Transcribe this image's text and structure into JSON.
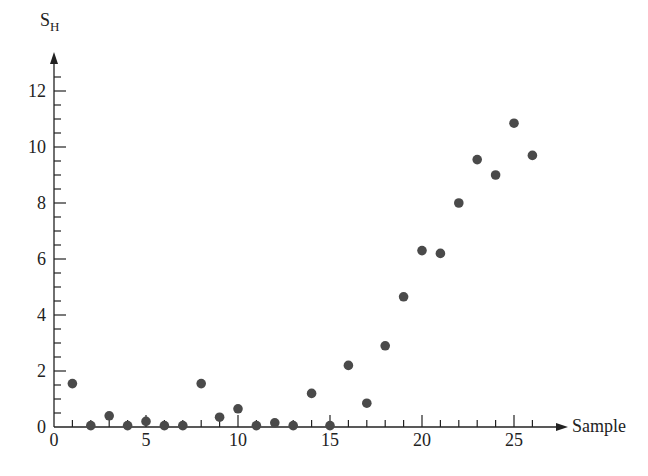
{
  "chart_data": {
    "type": "scatter",
    "title": "",
    "xlabel": "Sample",
    "ylabel": "S_H",
    "ylabel_main": "S",
    "ylabel_sub": "H",
    "xlim": [
      0,
      27
    ],
    "ylim": [
      0,
      13
    ],
    "x_ticks_major": [
      0,
      5,
      10,
      15,
      20,
      25
    ],
    "y_ticks_major": [
      0,
      2,
      4,
      6,
      8,
      10,
      12
    ],
    "x_tick_labels": [
      "0",
      "5",
      "10",
      "15",
      "20",
      "25"
    ],
    "y_tick_labels": [
      "0",
      "2",
      "4",
      "6",
      "8",
      "10",
      "12"
    ],
    "grid": false,
    "legend": null,
    "marker_color": "#4a4a4a",
    "x": [
      1,
      2,
      3,
      4,
      5,
      6,
      7,
      8,
      9,
      10,
      11,
      12,
      13,
      14,
      15,
      16,
      17,
      18,
      19,
      20,
      21,
      22,
      23,
      24,
      25,
      26
    ],
    "y": [
      1.55,
      0.05,
      0.4,
      0.05,
      0.2,
      0.05,
      0.05,
      1.55,
      0.35,
      0.65,
      0.05,
      0.15,
      0.05,
      1.2,
      0.05,
      2.2,
      0.85,
      2.9,
      4.65,
      6.3,
      6.2,
      8.0,
      9.55,
      9.0,
      10.85,
      9.7
    ]
  }
}
